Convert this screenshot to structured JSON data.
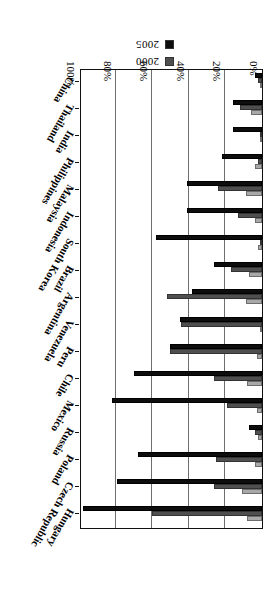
{
  "chart_data": {
    "type": "bar",
    "orientation": "horizontal",
    "title": "",
    "xlabel": "",
    "ylabel": "",
    "xlim": [
      0,
      100
    ],
    "xticks": [
      "0%",
      "20%",
      "40%",
      "60%",
      "80%",
      "100%"
    ],
    "xtick_values": [
      0,
      20,
      40,
      60,
      80,
      100
    ],
    "grid": true,
    "legend_position": "top-left",
    "categories": [
      "Hungary",
      "Czech Republic",
      "Poland",
      "Russia",
      "Mexico",
      "Chile",
      "Peru",
      "Venezuela",
      "Argentina",
      "Brazil",
      "South Korea",
      "Indonesia",
      "Malaysia",
      "Philippines",
      "India",
      "Thailand",
      "China"
    ],
    "series": [
      {
        "name": "1990",
        "color": "#a8a8a8",
        "values": [
          8,
          11,
          4,
          2,
          3,
          8,
          3,
          1,
          9,
          7,
          2,
          4,
          9,
          4,
          1,
          6,
          1
        ]
      },
      {
        "name": "2000",
        "color": "#4f4f4f",
        "values": [
          60,
          26,
          25,
          4,
          19,
          26,
          50,
          44,
          52,
          17,
          1,
          13,
          24,
          2,
          1,
          12,
          2
        ]
      },
      {
        "name": "2005",
        "color": "#0d0d0d",
        "values": [
          98,
          79,
          68,
          7,
          82,
          70,
          50,
          45,
          38,
          26,
          58,
          41,
          41,
          22,
          16,
          16,
          4
        ]
      }
    ]
  },
  "legend": {
    "items": [
      {
        "label": "1990",
        "color": "#a8a8a8"
      },
      {
        "label": "2000",
        "color": "#4f4f4f"
      },
      {
        "label": "2005",
        "color": "#0d0d0d"
      }
    ]
  }
}
